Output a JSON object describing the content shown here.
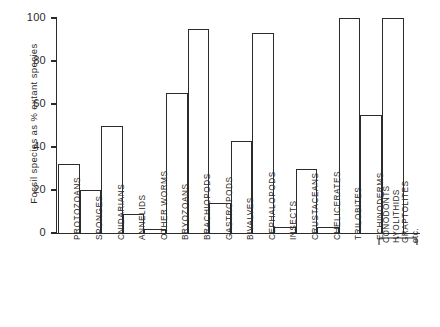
{
  "chart_data": {
    "type": "bar",
    "title": "",
    "xlabel": "",
    "ylabel": "Fossil species as % extant species",
    "ylim": [
      0,
      100
    ],
    "yticks": [
      0,
      20,
      40,
      60,
      80,
      100
    ],
    "grid": false,
    "legend": null,
    "orientation": "vertical",
    "bar_style": "open outline, white fill, black stroke",
    "categories": [
      "PROTOZOANS",
      "SPONGES",
      "CNIDARIANS",
      "ANNELIDS",
      "OTHER WORMS",
      "BRYOZOANS",
      "BRACHIOPODS",
      "GASTROPODS",
      "BIVALVES",
      "CEPHALOPODS",
      "INSECTS",
      "CRUSTACEANS",
      "CHELICERATES",
      "TRILOBITES",
      "ECHINODERMS",
      "CONODONTS HYOLITHIDS GRAPTOLITES etc."
    ],
    "values": [
      32,
      20,
      50,
      9,
      2,
      65,
      95,
      14,
      43,
      93,
      3,
      30,
      3,
      100,
      55,
      100
    ],
    "annotations": {
      "grouped_category_brace": {
        "label_lines": [
          "CONODONTS",
          "HYOLITHIDS",
          "GRAPTOLITES",
          "etc."
        ],
        "applies_to_category_index": 15
      }
    }
  },
  "axis": {
    "y_tick_labels": [
      "0",
      "20",
      "40",
      "60",
      "80",
      "100"
    ],
    "y_axis_title": "Fossil species as % extant species"
  },
  "colors": {
    "ink": "#2b2b2b",
    "bar_fill": "#ffffff",
    "background": "#ffffff"
  }
}
